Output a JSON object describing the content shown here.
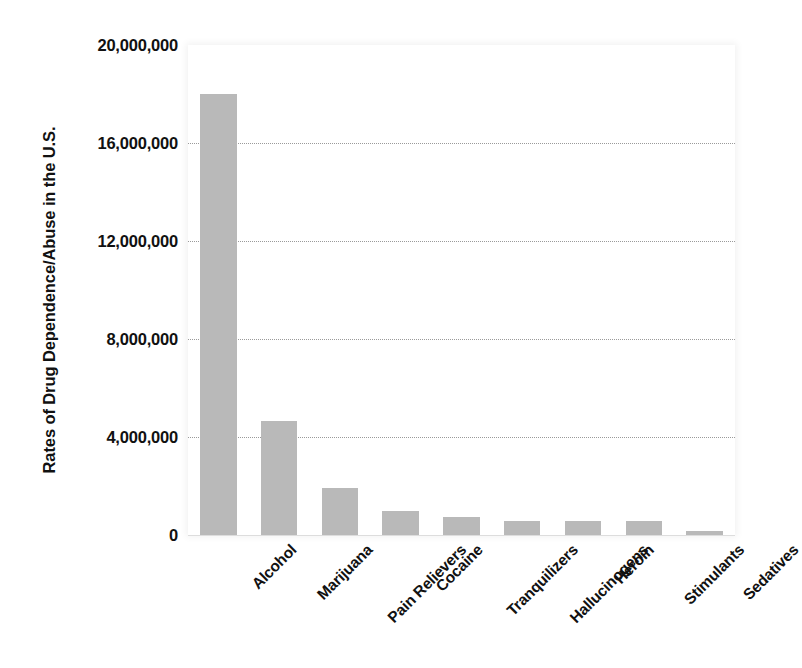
{
  "chart_data": {
    "type": "bar",
    "title": "",
    "xlabel": "",
    "ylabel": "Rates of Drug Dependence/Abuse in the U.S.",
    "categories": [
      "Alcohol",
      "Marijuana",
      "Pain Relievers",
      "Cocaine",
      "Tranquilizers",
      "Hallucinogens",
      "Heroin",
      "Stimulants",
      "Sedatives"
    ],
    "values": [
      18000000,
      4650000,
      1900000,
      1000000,
      750000,
      560000,
      560000,
      560000,
      150000
    ],
    "ylim": [
      0,
      20000000
    ],
    "yticks": [
      0,
      4000000,
      8000000,
      12000000,
      16000000,
      20000000
    ],
    "ytick_labels": [
      "0",
      "4,000,000",
      "8,000,000",
      "12,000,000",
      "16,000,000",
      "20,000,000"
    ],
    "grid": true,
    "grid_axis": "y",
    "grid_style": "dotted",
    "legend": false,
    "legend_position": "none",
    "bar_color": "#b9b9b9",
    "grid_color": "#9a9a9a",
    "text_color": "#111111",
    "background_color": "#ffffff",
    "xtick_rotation": -45
  }
}
